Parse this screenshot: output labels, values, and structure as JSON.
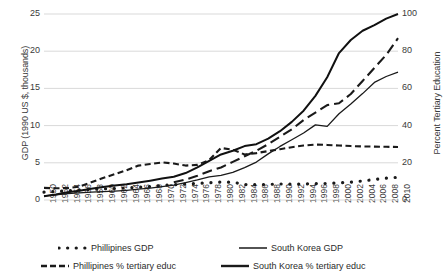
{
  "chart_data": {
    "type": "line",
    "title": "",
    "xlabel": "",
    "ylabel": "GDP (1990 US $, thousands)",
    "ylabel_right": "Percent Tertiary Education",
    "grid": true,
    "legend_position": "bottom",
    "ylim": [
      0,
      25
    ],
    "ylim_right": [
      0,
      100
    ],
    "yticks": [
      0,
      5,
      10,
      15,
      20,
      25
    ],
    "yticks_right": [
      0,
      20,
      40,
      60,
      80,
      100
    ],
    "xlim": [
      1950,
      2010
    ],
    "x": [
      1950,
      1952,
      1954,
      1956,
      1958,
      1960,
      1962,
      1964,
      1966,
      1968,
      1970,
      1972,
      1974,
      1976,
      1978,
      1980,
      1982,
      1984,
      1986,
      1988,
      1990,
      1992,
      1994,
      1996,
      1998,
      2000,
      2002,
      2004,
      2006,
      2008,
      2010
    ],
    "xticks": [
      "1950",
      "1952",
      "1954",
      "1956",
      "1958",
      "1960",
      "1962",
      "1964",
      "1966",
      "1968",
      "1970",
      "1972",
      "1974",
      "1976",
      "1978",
      "1980",
      "1982",
      "1984",
      "1986",
      "1988",
      "1990",
      "1992",
      "1994",
      "1996",
      "1998",
      "2000",
      "2002",
      "2004",
      "2006",
      "2008",
      "2010"
    ],
    "series": [
      {
        "name": "Phillipines GDP",
        "axis": "left",
        "style": "dotted",
        "color": "#1a1a1a",
        "values": [
          1.05,
          1.15,
          1.25,
          1.35,
          1.42,
          1.5,
          1.55,
          1.62,
          1.7,
          1.8,
          1.95,
          2.05,
          2.15,
          2.22,
          2.32,
          2.4,
          2.4,
          2.08,
          2.05,
          2.1,
          2.15,
          2.12,
          2.15,
          2.2,
          2.22,
          2.3,
          2.4,
          2.55,
          2.75,
          2.95,
          3.05
        ]
      },
      {
        "name": "South Korea GDP",
        "axis": "left",
        "style": "solid-thin",
        "color": "#1a1a1a",
        "values": [
          0.55,
          0.7,
          0.85,
          0.95,
          1.05,
          1.12,
          1.2,
          1.3,
          1.45,
          1.6,
          1.8,
          2.0,
          2.35,
          2.7,
          3.1,
          3.3,
          3.7,
          4.35,
          5.1,
          6.2,
          7.2,
          8.1,
          9.0,
          10.1,
          9.9,
          11.6,
          12.9,
          14.3,
          15.8,
          16.6,
          17.2
        ]
      },
      {
        "name": "Phillipines % tertiary educ",
        "axis": "right",
        "style": "dashed",
        "color": "#1a1a1a",
        "values": [
          6.5,
          6.3,
          6.4,
          7.2,
          9.5,
          11.8,
          13.9,
          16.0,
          18.5,
          19.4,
          20.2,
          19.6,
          18.5,
          18.9,
          21.5,
          28.0,
          27.0,
          24.5,
          25.2,
          26.3,
          27.3,
          28.4,
          29.3,
          29.8,
          29.6,
          29.3,
          29.0,
          28.8,
          28.7,
          28.6,
          28.5
        ]
      },
      {
        "name": "South Korea % tertiary educ",
        "axis": "right",
        "style": "solid-thick",
        "color": "#111111",
        "values": [
          2.0,
          3.0,
          4.2,
          5.0,
          6.0,
          7.0,
          7.8,
          8.5,
          9.4,
          10.4,
          11.5,
          12.5,
          14.5,
          17.5,
          21.0,
          24.5,
          26.5,
          29.0,
          30.0,
          33.0,
          37.0,
          42.0,
          48.0,
          56.0,
          66.0,
          79.0,
          86.0,
          91.0,
          94.0,
          97.5,
          100.0
        ]
      },
      {
        "name": "South Korea % tertiary educ dashed overlay",
        "axis": "right",
        "style": "dashed-long",
        "color": "#1a1a1a",
        "values": [
          null,
          null,
          null,
          null,
          null,
          null,
          null,
          null,
          null,
          null,
          null,
          9.5,
          11.0,
          13.0,
          15.5,
          17.5,
          20.5,
          23.5,
          26.5,
          30.0,
          34.0,
          38.0,
          43.0,
          47.0,
          51.0,
          52.0,
          57.0,
          64.0,
          71.0,
          78.0,
          87.0
        ]
      }
    ]
  },
  "legend": {
    "items": [
      {
        "label": "Phillipines GDP",
        "style": "dotted"
      },
      {
        "label": "South Korea GDP",
        "style": "solid-thin"
      },
      {
        "label": "Phillipines % tertiary educ",
        "style": "dashed"
      },
      {
        "label": "South Korea % tertiary educ",
        "style": "solid-thick"
      }
    ]
  },
  "colors": {
    "line": "#1a1a1a",
    "grid": "#d9d9d9",
    "text": "#3a3a3a"
  }
}
